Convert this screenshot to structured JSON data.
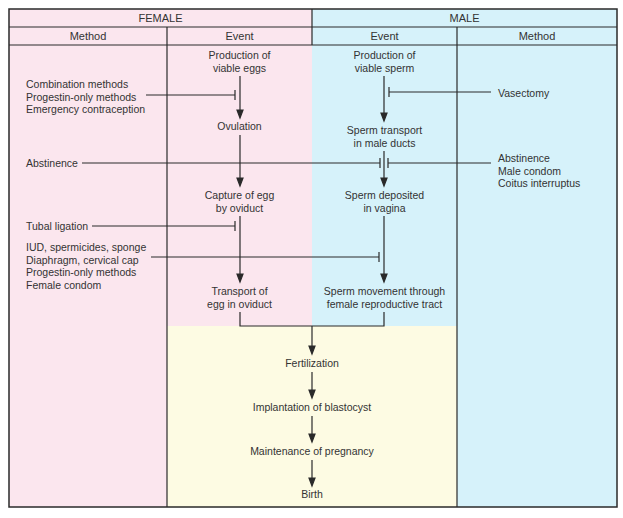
{
  "header": {
    "female_label": "FEMALE",
    "male_label": "MALE",
    "columns": [
      "Method",
      "Event",
      "Event",
      "Method"
    ]
  },
  "female_events": [
    [
      "Production of",
      "viable eggs"
    ],
    [
      "Ovulation"
    ],
    [
      "Capture of egg",
      "by oviduct"
    ],
    [
      "Transport of",
      "egg in oviduct"
    ]
  ],
  "male_events": [
    [
      "Production of",
      "viable sperm"
    ],
    [
      "Sperm transport",
      "in male ducts"
    ],
    [
      "Sperm deposited",
      "in vagina"
    ],
    [
      "Sperm movement through",
      "female reproductive tract"
    ]
  ],
  "shared_events": [
    "Fertilization",
    "Implantation of blastocyst",
    "Maintenance of pregnancy",
    "Birth"
  ],
  "female_methods": {
    "hormonal": [
      "Combination methods",
      "Progestin-only methods",
      "Emergency contraception"
    ],
    "abstinence": "Abstinence",
    "tubal": "Tubal ligation",
    "barrier": [
      "IUD, spermicides, sponge",
      "Diaphragm, cervical cap",
      "Progestin-only methods",
      "Female condom"
    ]
  },
  "male_methods": {
    "vasectomy": "Vasectomy",
    "behavioral": [
      "Abstinence",
      "Male condom",
      "Coitus interruptus"
    ]
  },
  "colors": {
    "female_bg": "#fbe6ee",
    "male_bg": "#d6f2fa",
    "shared_bg": "#fdfbe3",
    "line": "#2a2a2a"
  }
}
